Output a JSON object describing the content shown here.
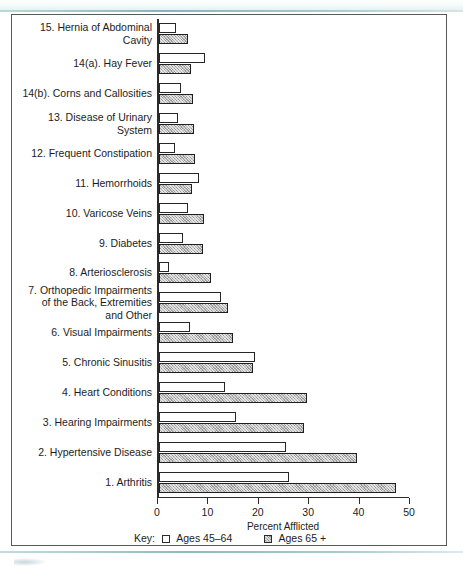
{
  "chart_data": {
    "type": "bar",
    "orientation": "horizontal",
    "title": "",
    "xlabel": "Percent Afflicted",
    "ylabel": "",
    "xlim": [
      0,
      50
    ],
    "xticks": [
      0,
      10,
      20,
      30,
      40,
      50
    ],
    "grid": false,
    "legend_position": "bottom",
    "legend_prefix": "Key:",
    "categories": [
      "15. Hernia of Abdominal Cavity",
      "14(a). Hay Fever",
      "14(b). Corns and Callosities",
      "13. Disease of Urinary System",
      "12. Frequent Constipation",
      "11. Hemorrhoids",
      "10. Varicose Veins",
      "9. Diabetes",
      "8. Arteriosclerosis",
      "7. Orthopedic Impairments\nof the Back, Extremities\nand Other",
      "6. Visual Impairments",
      "5. Chronic Sinusitis",
      "4. Heart Conditions",
      "3. Hearing Impairments",
      "2. Hypertensive Disease",
      "1. Arthritis"
    ],
    "series": [
      {
        "name": "Ages 45–64",
        "key": "young",
        "values": [
          3.4,
          9.2,
          4.4,
          3.8,
          3.2,
          8.0,
          5.8,
          4.8,
          2.0,
          12.4,
          6.2,
          19.0,
          13.0,
          15.2,
          25.2,
          25.8
        ]
      },
      {
        "name": "Ages 65 +",
        "key": "old",
        "values": [
          5.8,
          6.4,
          6.8,
          7.0,
          7.2,
          6.6,
          9.0,
          8.8,
          10.4,
          13.6,
          14.6,
          18.6,
          29.4,
          28.8,
          39.2,
          47.0
        ]
      }
    ]
  },
  "colors": {
    "young_fill": "#ffffff",
    "old_fill": "#b9b9b9",
    "bar_outline": "#262626",
    "axis": "#2b2b2b",
    "frame": "#5a5a5a",
    "text": "#1c1c1c",
    "rule_accent": "#8fb9c0"
  }
}
